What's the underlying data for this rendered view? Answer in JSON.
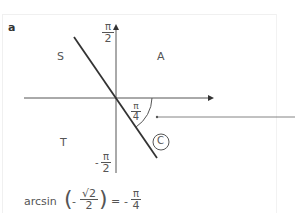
{
  "panel": {
    "label": "a"
  },
  "quadrants": {
    "s": "S",
    "a": "A",
    "t": "T",
    "c": "C"
  },
  "axis_labels": {
    "y_top": {
      "num": "π",
      "den": "2"
    },
    "y_bottom": {
      "sign": "-",
      "num": "π",
      "den": "2"
    },
    "angle": {
      "num": "π",
      "den": "4"
    }
  },
  "formula": {
    "func": "arcsin",
    "arg_sign": "-",
    "arg_num": "√2",
    "arg_den": "2",
    "equals": "=",
    "result_sign": "-",
    "result_num": "π",
    "result_den": "4"
  },
  "colors": {
    "axis": "#555555",
    "line": "#333333",
    "text": "#555555",
    "border": "#f0f0f0"
  }
}
